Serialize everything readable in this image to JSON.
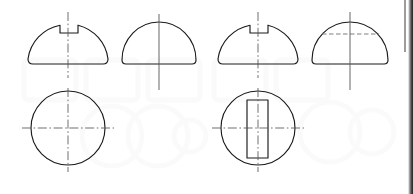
{
  "document": {
    "title": "Keyed shaft end orthographic views",
    "sheet_width": 413,
    "sheet_height": 194,
    "background_color": "#ffffff",
    "line_color": "#1a1a1a",
    "centerline_color": "#555555",
    "hidden_line_color": "#777777",
    "watermark_color": "#f2f2f2",
    "units": "px"
  },
  "figures": [
    {
      "id": "fig-1",
      "name": "d-profile-with-keyway-notch",
      "view": "front-elevation",
      "shape": "semicircular-d-profile",
      "has_notch": true,
      "has_hidden_line": false,
      "centerline": "vertical-dash-dot",
      "geometry": {
        "left": 28,
        "right": 108,
        "base_y": 64,
        "top_y": 20,
        "center_x": 68,
        "radius_x": 40,
        "radius_y": 40,
        "corner_radius": 5,
        "notch_left": 60,
        "notch_right": 78,
        "notch_depth_y": 33,
        "centerline_top": 12,
        "centerline_bottom": 78
      }
    },
    {
      "id": "fig-2",
      "name": "d-profile-plain",
      "view": "side-elevation",
      "shape": "semicircular-d-profile",
      "has_notch": false,
      "has_hidden_line": false,
      "centerline": "vertical-solid",
      "geometry": {
        "left": 122,
        "right": 196,
        "base_y": 64,
        "top_y": 22,
        "center_x": 159,
        "radius_x": 37,
        "radius_y": 38,
        "corner_radius": 4,
        "centerline_top": 14,
        "centerline_bottom": 90
      }
    },
    {
      "id": "fig-3",
      "name": "d-profile-with-keyway-notch-2",
      "view": "front-elevation",
      "shape": "semicircular-d-profile",
      "has_notch": true,
      "has_hidden_line": false,
      "centerline": "vertical-dash-dot",
      "geometry": {
        "left": 218,
        "right": 298,
        "base_y": 64,
        "top_y": 20,
        "center_x": 258,
        "radius_x": 40,
        "radius_y": 40,
        "corner_radius": 5,
        "notch_left": 250,
        "notch_right": 268,
        "notch_depth_y": 33,
        "centerline_top": 12,
        "centerline_bottom": 78
      }
    },
    {
      "id": "fig-4",
      "name": "d-profile-with-hidden-keyway",
      "view": "side-elevation",
      "shape": "semicircular-d-profile",
      "has_notch": false,
      "has_hidden_line": true,
      "centerline": "vertical-solid",
      "geometry": {
        "left": 312,
        "right": 388,
        "base_y": 64,
        "top_y": 22,
        "center_x": 350,
        "radius_x": 38,
        "radius_y": 38,
        "corner_radius": 4,
        "hidden_line_y": 34,
        "hidden_line_left": 322,
        "hidden_line_right": 379,
        "centerline_top": 12,
        "centerline_bottom": 90
      }
    },
    {
      "id": "fig-5",
      "name": "circular-section-plain",
      "view": "plan-section",
      "shape": "circle",
      "has_slot": false,
      "centerline": "cross-dash-dot",
      "geometry": {
        "center_x": 68,
        "center_y": 128,
        "radius": 37,
        "centerline_v_top": 88,
        "centerline_v_bottom": 172,
        "centerline_h_left": 22,
        "centerline_h_right": 114
      }
    },
    {
      "id": "fig-6",
      "name": "circular-section-with-keyway-slot",
      "view": "plan-section",
      "shape": "circle",
      "has_slot": true,
      "centerline": "cross-dash-dot",
      "geometry": {
        "center_x": 258,
        "center_y": 128,
        "radius": 37,
        "slot_left": 247,
        "slot_right": 268,
        "slot_top": 100,
        "slot_bottom": 158,
        "centerline_v_top": 88,
        "centerline_v_bottom": 172,
        "centerline_h_left": 212,
        "centerline_h_right": 304
      }
    }
  ],
  "watermark": {
    "visible": true,
    "opacity": 0.35,
    "shapes": [
      {
        "type": "rounded-rect",
        "x": 24,
        "y": 60,
        "width": 52,
        "height": 40
      },
      {
        "type": "rounded-rect",
        "x": 86,
        "y": 60,
        "width": 52,
        "height": 40
      },
      {
        "type": "rounded-rect",
        "x": 148,
        "y": 60,
        "width": 52,
        "height": 40
      },
      {
        "type": "rounded-rect",
        "x": 214,
        "y": 60,
        "width": 52,
        "height": 40
      },
      {
        "type": "rounded-rect",
        "x": 276,
        "y": 60,
        "width": 52,
        "height": 40
      },
      {
        "type": "ring",
        "cx": 112,
        "cy": 136,
        "r": 30
      },
      {
        "type": "ring",
        "cx": 158,
        "cy": 136,
        "r": 30
      },
      {
        "type": "ring",
        "cx": 190,
        "cy": 136,
        "r": 16
      },
      {
        "type": "ring",
        "cx": 330,
        "cy": 132,
        "r": 30
      },
      {
        "type": "ring",
        "cx": 372,
        "cy": 132,
        "r": 22
      }
    ]
  },
  "page_edge": {
    "name": "scanned-page-edge-artifact",
    "visible": true
  }
}
